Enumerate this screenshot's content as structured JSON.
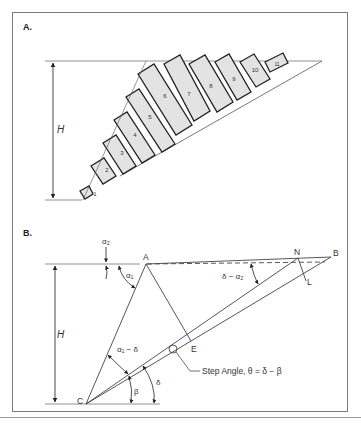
{
  "panels": {
    "a": {
      "label": "A.",
      "dimension_label": "H",
      "blocks": [
        "1",
        "2",
        "3",
        "4",
        "5",
        "6",
        "7",
        "8",
        "9",
        "10",
        "11"
      ]
    },
    "b": {
      "label": "B.",
      "dimension_label": "H",
      "points": {
        "A": "A",
        "B": "B",
        "C": "C",
        "E": "E",
        "L": "L",
        "N": "N"
      },
      "angles": {
        "alpha2": "α₂",
        "alpha1": "α₁",
        "delta_minus_alpha2": "δ − α₂",
        "alpha1_minus_delta": "α₁ − δ",
        "beta": "β",
        "delta": "δ"
      },
      "annotation": "Step Angle, θ = δ − β"
    }
  },
  "colors": {
    "block_fill": "#e3e3e3",
    "block_stroke": "#222222",
    "line": "#555555"
  }
}
